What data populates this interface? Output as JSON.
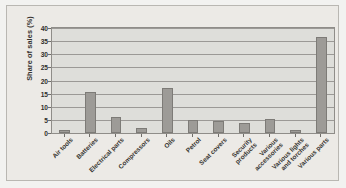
{
  "chart_data": {
    "type": "bar",
    "title": "",
    "xlabel": "",
    "ylabel": "Share of sales (%)",
    "ylim": [
      0,
      40
    ],
    "ytick_step": 5,
    "yticks": [
      "40",
      "35",
      "30",
      "25",
      "20",
      "15",
      "10",
      "5",
      "0"
    ],
    "grid": true,
    "legend": "none",
    "categories": [
      "Air tools",
      "Batteries",
      "Electrical parts",
      "Compressors",
      "Oils",
      "Petrol",
      "Seat covers",
      "Security\nproducts",
      "Various\naccessories",
      "Various lights\nand torches",
      "Various parts"
    ],
    "values": [
      1.3,
      15.5,
      6.2,
      1.8,
      17,
      5,
      4.5,
      4,
      5.5,
      1.3,
      36.5
    ],
    "series": [
      {
        "name": "Share of sales",
        "values": [
          1.3,
          15.5,
          6.2,
          1.8,
          17,
          5,
          4.5,
          4,
          5.5,
          1.3,
          36.5
        ]
      }
    ]
  },
  "style": {
    "bar_fill": "#9d9b97",
    "bar_border": "#7d7b77",
    "plot_background": "#dededa",
    "figure_background": "#eceae6",
    "page_background": "#f2f2f0",
    "gridline_color": "#8f8d89",
    "text_color": "#35332f"
  }
}
